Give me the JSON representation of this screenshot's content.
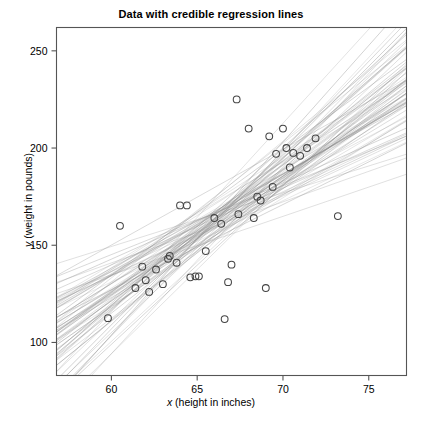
{
  "figure": {
    "title": "Data with credible regression lines",
    "width": 422,
    "height": 421
  },
  "axes": {
    "x_label_italic": "x",
    "x_label_rest": " (height in inches)",
    "y_label_italic": "y",
    "y_label_rest": " (weight in pounds)",
    "x_ticks": [
      "60",
      "65",
      "70",
      "75"
    ],
    "y_ticks": [
      "100",
      "150",
      "200",
      "250"
    ],
    "frame_color": "#555555",
    "point_color": "#444444",
    "line_color": "#8c8c8c"
  },
  "chart_data": {
    "type": "scatter",
    "title": "Data with credible regression lines",
    "xlabel": "x (height in inches)",
    "ylabel": "y (weight in pounds)",
    "xlim": [
      56.8,
      77.2
    ],
    "ylim": [
      83,
      262
    ],
    "xticks": [
      60,
      65,
      70,
      75
    ],
    "yticks": [
      100,
      150,
      200,
      250
    ],
    "grid": false,
    "legend": null,
    "marker": "open-circle",
    "points": [
      {
        "x": 59.8,
        "y": 112.5
      },
      {
        "x": 60.5,
        "y": 160.0
      },
      {
        "x": 61.4,
        "y": 128.0
      },
      {
        "x": 61.8,
        "y": 139.0
      },
      {
        "x": 62.0,
        "y": 132.0
      },
      {
        "x": 62.2,
        "y": 126.0
      },
      {
        "x": 62.6,
        "y": 137.5
      },
      {
        "x": 63.0,
        "y": 130.0
      },
      {
        "x": 63.3,
        "y": 143.0
      },
      {
        "x": 63.4,
        "y": 144.5
      },
      {
        "x": 63.8,
        "y": 141.0
      },
      {
        "x": 64.0,
        "y": 170.5
      },
      {
        "x": 64.4,
        "y": 170.5
      },
      {
        "x": 64.6,
        "y": 133.5
      },
      {
        "x": 64.9,
        "y": 134.0
      },
      {
        "x": 65.1,
        "y": 134.0
      },
      {
        "x": 65.5,
        "y": 147.0
      },
      {
        "x": 66.0,
        "y": 164.0
      },
      {
        "x": 66.4,
        "y": 161.0
      },
      {
        "x": 66.6,
        "y": 112.0
      },
      {
        "x": 66.8,
        "y": 131.0
      },
      {
        "x": 67.0,
        "y": 140.0
      },
      {
        "x": 67.3,
        "y": 225.0
      },
      {
        "x": 67.4,
        "y": 166.0
      },
      {
        "x": 68.0,
        "y": 210.0
      },
      {
        "x": 68.3,
        "y": 164.0
      },
      {
        "x": 68.5,
        "y": 175.0
      },
      {
        "x": 68.7,
        "y": 173.0
      },
      {
        "x": 69.0,
        "y": 128.0
      },
      {
        "x": 69.2,
        "y": 206.0
      },
      {
        "x": 69.4,
        "y": 180.0
      },
      {
        "x": 69.6,
        "y": 197.0
      },
      {
        "x": 70.0,
        "y": 210.0
      },
      {
        "x": 70.2,
        "y": 200.0
      },
      {
        "x": 70.4,
        "y": 190.0
      },
      {
        "x": 70.6,
        "y": 197.5
      },
      {
        "x": 71.0,
        "y": 196.0
      },
      {
        "x": 71.4,
        "y": 200.0
      },
      {
        "x": 71.9,
        "y": 205.0
      },
      {
        "x": 73.2,
        "y": 165.0
      }
    ],
    "regression_lines_note": "Posterior credible regression lines",
    "regression_lines_count": 75,
    "regression_center": {
      "x": 66.3,
      "y": 163.0
    },
    "regression_slope_mean": 6.3,
    "regression_slope_sd": 1.85
  }
}
